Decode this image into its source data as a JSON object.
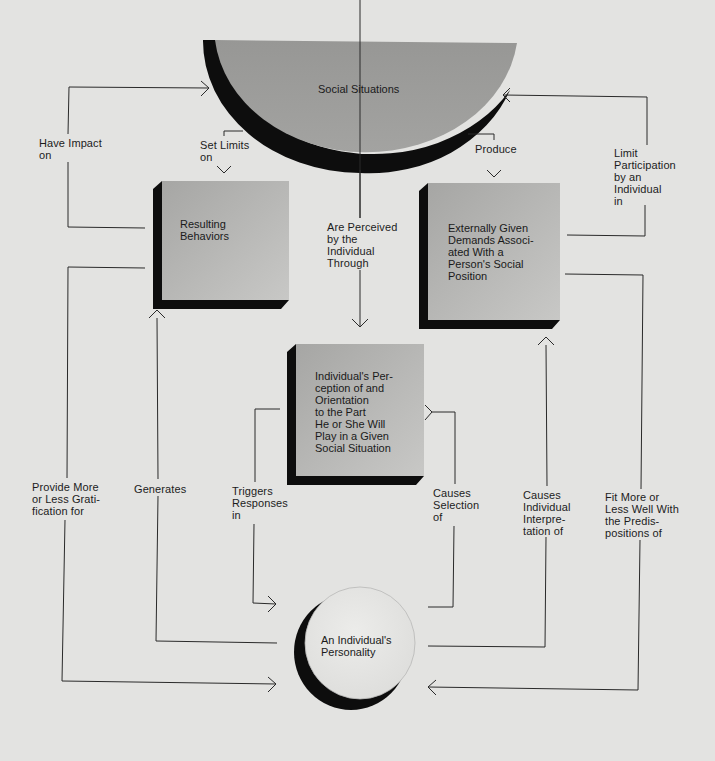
{
  "diagram": {
    "colors": {
      "background": "#e3e3e1",
      "node_fill_top": "#a9a9a7",
      "node_fill_bottom": "#c6c6c4",
      "semicircle_fill": "#9a9a98",
      "circle_fill": "#e6e6e4",
      "shadow": "#0d0d0d",
      "line": "#2a2a2a"
    },
    "nodes": {
      "social_situations": {
        "label": "Social Situations",
        "shape": "half-circle"
      },
      "resulting_behaviors": {
        "label": "Resulting\nBehaviors",
        "shape": "box"
      },
      "external_demands": {
        "label": "Externally Given\nDemands Associ-\nated With a\nPerson's Social\nPosition",
        "shape": "box"
      },
      "perception": {
        "label": "Individual's Per-\nception of and\nOrientation\nto the Part\nHe or She Will\nPlay in a Given\nSocial Situation",
        "shape": "box"
      },
      "personality": {
        "label": "An Individual's\nPersonality",
        "shape": "circle"
      }
    },
    "edges": [
      {
        "id": "have_impact_on",
        "label": "Have Impact\non",
        "from": "resulting_behaviors",
        "to": "social_situations"
      },
      {
        "id": "set_limits_on",
        "label": "Set Limits\non",
        "from": "social_situations",
        "to": "resulting_behaviors"
      },
      {
        "id": "produce",
        "label": "Produce",
        "from": "social_situations",
        "to": "external_demands"
      },
      {
        "id": "limit_participation",
        "label": "Limit\nParticipation\nby an\nIndividual\nin",
        "from": "external_demands",
        "to": "social_situations"
      },
      {
        "id": "are_perceived",
        "label": "Are Perceived\nby the\nIndividual\nThrough",
        "from": "social_situations",
        "to": "perception"
      },
      {
        "id": "provide_gratification",
        "label": "Provide More\nor Less Grati-\nfication for",
        "from": "resulting_behaviors",
        "to": "personality"
      },
      {
        "id": "generates",
        "label": "Generates",
        "from": "personality",
        "to": "resulting_behaviors"
      },
      {
        "id": "triggers_responses",
        "label": "Triggers\nResponses\nin",
        "from": "perception",
        "to": "personality"
      },
      {
        "id": "causes_selection",
        "label": "Causes\nSelection\nof",
        "from": "personality",
        "to": "perception"
      },
      {
        "id": "causes_interpretation",
        "label": "Causes\nIndividual\nInterpre-\ntation of",
        "from": "personality",
        "to": "external_demands"
      },
      {
        "id": "fit_predispositions",
        "label": "Fit More or\nLess Well With\nthe Predis-\npositions of",
        "from": "external_demands",
        "to": "personality"
      }
    ]
  }
}
